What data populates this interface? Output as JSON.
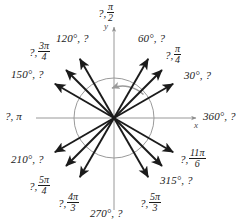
{
  "figure": {
    "type": "unit-circle-angle-diagram",
    "axis_labels": {
      "x": "x",
      "y": "y"
    },
    "colors": {
      "arrow": "#1b1b1b",
      "circle": "#9a9a9a",
      "axis": "#8d8d8d",
      "sweep_arc": "#9a9a9a",
      "text": "#1b1b1b"
    },
    "center": {
      "x": 114,
      "y": 118
    },
    "circle_radius": 40,
    "sweep": {
      "from_deg": 0,
      "to_deg": 95,
      "direction": "counterclockwise"
    }
  },
  "labels": [
    {
      "id": "a90",
      "angle_deg": 90,
      "degrees": "",
      "radians_num": "π",
      "radians_den": "2",
      "pre": "?,",
      "post": "",
      "kind": "radian-unknown-degree"
    },
    {
      "id": "a60",
      "angle_deg": 60,
      "degrees": "60°, ?",
      "kind": "degree-known"
    },
    {
      "id": "a45",
      "angle_deg": 45,
      "radians_num": "π",
      "radians_den": "4",
      "pre": "?,",
      "kind": "radian-known"
    },
    {
      "id": "a30",
      "angle_deg": 30,
      "degrees": "30°, ?",
      "kind": "degree-known"
    },
    {
      "id": "a0",
      "angle_deg": 0,
      "degrees": "360°, ?",
      "kind": "degree-known"
    },
    {
      "id": "a330",
      "angle_deg": 330,
      "radians_num": "11π",
      "radians_den": "6",
      "pre": "?,",
      "kind": "radian-known"
    },
    {
      "id": "a315",
      "angle_deg": 315,
      "degrees": "315°, ?",
      "kind": "degree-known"
    },
    {
      "id": "a300",
      "angle_deg": 300,
      "radians_num": "5π",
      "radians_den": "3",
      "pre": "?,",
      "kind": "radian-known"
    },
    {
      "id": "a270",
      "angle_deg": 270,
      "degrees": "270°, ?",
      "kind": "degree-known"
    },
    {
      "id": "a240",
      "angle_deg": 240,
      "radians_num": "4π",
      "radians_den": "3",
      "pre": "?,",
      "kind": "radian-known"
    },
    {
      "id": "a225",
      "angle_deg": 225,
      "radians_num": "5π",
      "radians_den": "4",
      "pre": "?,",
      "kind": "radian-known"
    },
    {
      "id": "a210",
      "angle_deg": 210,
      "degrees": "210°, ?",
      "kind": "degree-known"
    },
    {
      "id": "a180",
      "angle_deg": 180,
      "degrees": "",
      "radians_plain": "?, π",
      "kind": "radian-known-plain"
    },
    {
      "id": "a150",
      "angle_deg": 150,
      "degrees": "150°, ?",
      "kind": "degree-known"
    },
    {
      "id": "a135",
      "angle_deg": 135,
      "radians_num": "3π",
      "radians_den": "4",
      "pre": "?,",
      "kind": "radian-known"
    },
    {
      "id": "a120",
      "angle_deg": 120,
      "degrees": "120°, ?",
      "kind": "degree-known"
    }
  ],
  "text": {
    "l90_pre": "?,",
    "l90_num": "π",
    "l90_den": "2",
    "l60": "60°, ?",
    "l45_pre": "?,",
    "l45_num": "π",
    "l45_den": "4",
    "l30": "30°, ?",
    "l0": "360°, ?",
    "l330_pre": "?,",
    "l330_num": "11π",
    "l330_den": "6",
    "l315": "315°, ?",
    "l300_pre": "?,",
    "l300_num": "5π",
    "l300_den": "3",
    "l270": "270°, ?",
    "l240_pre": "?,",
    "l240_num": "4π",
    "l240_den": "3",
    "l225_pre": "?,",
    "l225_num": "5π",
    "l225_den": "4",
    "l210": "210°, ?",
    "l180": "?, π",
    "l150": "150°, ?",
    "l135_pre": "?,",
    "l135_num": "3π",
    "l135_den": "4",
    "l120": "120°, ?",
    "axis_x": "x",
    "axis_y": "y"
  }
}
